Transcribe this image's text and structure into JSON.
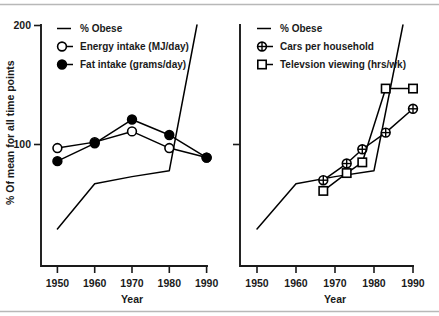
{
  "figure": {
    "width": 439,
    "height": 316,
    "background": "#ffffff",
    "rule_color": "#b8b8b8",
    "line_color": "#000000",
    "text_color": "#1a1a1a"
  },
  "shared": {
    "xlabel": "Year",
    "ylabel": "% Of mean for all time points",
    "xticks": [
      "1950",
      "1960",
      "1970",
      "1980",
      "1990"
    ],
    "yticks": [
      "100",
      "200"
    ]
  },
  "chart_data": [
    {
      "type": "line",
      "panel": "left",
      "title": "",
      "xlabel": "Year",
      "ylabel": "% Of mean for all time points",
      "xlim": [
        1945,
        1995
      ],
      "ylim": [
        0,
        200
      ],
      "xticks": [
        1950,
        1960,
        1970,
        1980,
        1990
      ],
      "yticks": [
        100,
        200
      ],
      "grid": false,
      "legend_position": "top-left",
      "series": [
        {
          "name": "% Obese",
          "marker": "none",
          "x": [
            1950,
            1960,
            1970,
            1980,
            1990
          ],
          "values": [
            29,
            67,
            73,
            78,
            243
          ]
        },
        {
          "name": "Energy intake (MJ/day)",
          "marker": "open-circle",
          "x": [
            1950,
            1960,
            1970,
            1980,
            1990
          ],
          "values": [
            97,
            102,
            111,
            97,
            89
          ]
        },
        {
          "name": "Fat intake (grams/day)",
          "marker": "filled-circle",
          "x": [
            1950,
            1960,
            1970,
            1980,
            1990
          ],
          "values": [
            86,
            101,
            121,
            108,
            89
          ]
        }
      ]
    },
    {
      "type": "line",
      "panel": "right",
      "title": "",
      "xlabel": "Year",
      "ylabel": "",
      "xlim": [
        1945,
        1995
      ],
      "ylim": [
        0,
        200
      ],
      "xticks": [
        1950,
        1960,
        1970,
        1980,
        1990
      ],
      "yticks": [
        100,
        200
      ],
      "grid": false,
      "legend_position": "top-left",
      "series": [
        {
          "name": "% Obese",
          "marker": "none",
          "x": [
            1950,
            1960,
            1970,
            1980,
            1990
          ],
          "values": [
            29,
            67,
            73,
            78,
            243
          ]
        },
        {
          "name": "Cars per household",
          "marker": "crossed-circle",
          "x": [
            1967,
            1973,
            1977,
            1983,
            1990
          ],
          "values": [
            70,
            84,
            96,
            110,
            130
          ]
        },
        {
          "name": "Televsion viewing (hrs/wk)",
          "marker": "open-square",
          "x": [
            1967,
            1973,
            1977,
            1983,
            1990
          ],
          "values": [
            61,
            76,
            85,
            147,
            147
          ]
        }
      ]
    }
  ],
  "legends": {
    "left": [
      {
        "label": "% Obese",
        "marker": "none"
      },
      {
        "label": "Energy intake (MJ/day)",
        "marker": "open-circle"
      },
      {
        "label": "Fat intake (grams/day)",
        "marker": "filled-circle"
      }
    ],
    "right": [
      {
        "label": "% Obese",
        "marker": "none"
      },
      {
        "label": "Cars per household",
        "marker": "crossed-circle"
      },
      {
        "label": "Televsion viewing (hrs/wk)",
        "marker": "open-square"
      }
    ]
  }
}
